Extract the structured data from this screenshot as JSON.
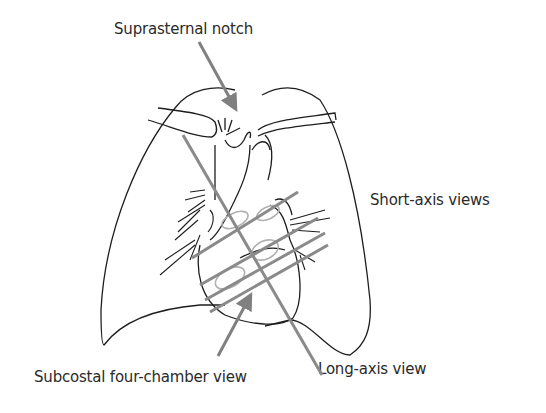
{
  "labels": {
    "suprasternal": "Suprasternal notch",
    "short_axis": "Short-axis views",
    "subcostal": "Subcostal four-chamber view",
    "long_axis": "Long-axis view"
  },
  "colors": {
    "outline": "#1e1e1e",
    "arrow": "#808080",
    "plane_line": "#8a8a8a",
    "ellipse": "#b0b0b0",
    "text": "#2a2a2a"
  }
}
